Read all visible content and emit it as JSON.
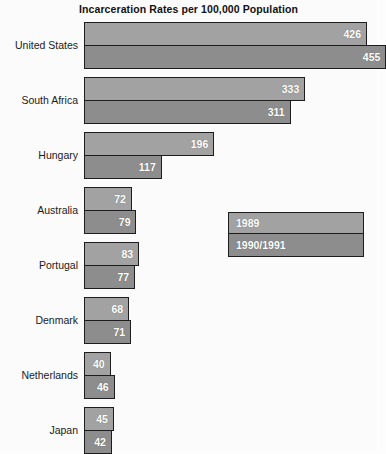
{
  "chart_data": {
    "type": "bar",
    "orientation": "horizontal",
    "title": "Incarceration Rates per 100,000 Population",
    "xlabel": "",
    "ylabel": "",
    "grid": false,
    "xlim": [
      0,
      455
    ],
    "legend_position": "middle-right",
    "categories": [
      "United States",
      "South Africa",
      "Hungary",
      "Australia",
      "Portugal",
      "Denmark",
      "Netherlands",
      "Japan"
    ],
    "series": [
      {
        "name": "1989",
        "color": "#a2a2a2",
        "values": [
          426,
          333,
          196,
          72,
          83,
          68,
          40,
          45
        ]
      },
      {
        "name": "1990/1991",
        "color": "#8d8d8d",
        "values": [
          455,
          311,
          117,
          79,
          77,
          71,
          46,
          42
        ]
      }
    ]
  },
  "legend": {
    "items": [
      {
        "label": "1989"
      },
      {
        "label": "1990/1991"
      }
    ]
  },
  "colors": {
    "series_1989": "#a2a2a2",
    "series_1990_1991": "#8d8d8d",
    "outline": "#1d1d1d",
    "value_text": "#ffffff",
    "label_text": "#1a1a1a",
    "background": "#fbfbfb"
  }
}
